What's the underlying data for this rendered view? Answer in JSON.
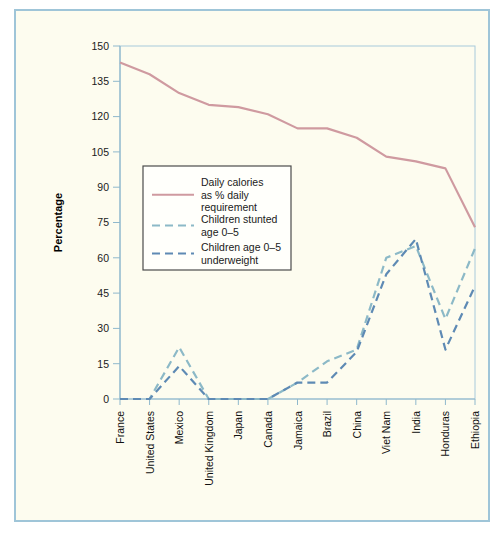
{
  "figure": {
    "background_color": "#fdfcef",
    "frame_color": "#9fc5d8"
  },
  "chart_data": {
    "type": "line",
    "title": "",
    "xlabel": "",
    "ylabel": "Percentage",
    "ylim": [
      0,
      150
    ],
    "ytick_step": 15,
    "yticks": [
      "0",
      "15",
      "30",
      "45",
      "60",
      "75",
      "90",
      "105",
      "120",
      "135",
      "150"
    ],
    "grid": false,
    "legend_position": "inner-left",
    "categories": [
      "France",
      "United States",
      "Mexico",
      "United Kingdom",
      "Japan",
      "Canada",
      "Jamaica",
      "Brazil",
      "China",
      "Viet Nam",
      "India",
      "Honduras",
      "Ethiopia"
    ],
    "series": [
      {
        "name": "Daily calories as % daily requirement",
        "legend_label_lines": [
          "Daily calories",
          "as % daily",
          "requirement"
        ],
        "color": "#cf9aa0",
        "style": "solid",
        "width": 2.2,
        "values": [
          143,
          138,
          130,
          125,
          124,
          121,
          115,
          115,
          111,
          103,
          101,
          98,
          73
        ]
      },
      {
        "name": "Children stunted age 0-5",
        "legend_label_lines": [
          "Children stunted",
          "age 0–5"
        ],
        "color": "#8cb9c7",
        "style": "dashed",
        "width": 2.2,
        "values": [
          0,
          0,
          22,
          0,
          0,
          0,
          7,
          16,
          21,
          60,
          65,
          34,
          64
        ]
      },
      {
        "name": "Children age 0-5 underweight",
        "legend_label_lines": [
          "Children age 0–5",
          "underweight"
        ],
        "color": "#5e8ab4",
        "style": "dashed",
        "width": 2.2,
        "values": [
          0,
          0,
          14,
          0,
          0,
          0,
          7,
          7,
          20,
          53,
          68,
          21,
          48
        ]
      }
    ]
  },
  "axes": {
    "y_axis_title": "Percentage"
  }
}
